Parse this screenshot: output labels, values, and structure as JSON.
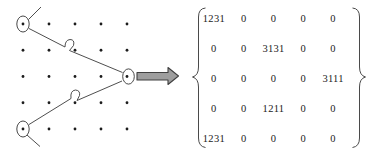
{
  "figure": {
    "grid": {
      "rows": 5,
      "cols": 5
    },
    "circled_nodes": [
      "row-1-col-1 (top-left)",
      "row-3-col-5 (middle-right)",
      "row-5-col-1 (bottom-left)"
    ],
    "paths": [
      "upper branch: top-left circled node down-right with hop to middle-right circled node",
      "lower branch: bottom-left circled node up-right with hop to middle-right circled node"
    ],
    "arrow": {
      "direction": "right",
      "fill": "#9e9e9e",
      "outline": "#404040"
    }
  },
  "matrix": {
    "left_delimiter": "{",
    "right_delimiter": "}",
    "rows": 5,
    "cols": 5,
    "values": [
      [
        "1231",
        "0",
        "0",
        "0",
        "0"
      ],
      [
        "0",
        "0",
        "3131",
        "0",
        "0"
      ],
      [
        "0",
        "0",
        "0",
        "0",
        "3111"
      ],
      [
        "0",
        "0",
        "1211",
        "0",
        "0"
      ],
      [
        "1231",
        "0",
        "0",
        "0",
        "0"
      ]
    ]
  },
  "colors": {
    "dot": "#1c1c1c",
    "line": "#3a3a3a",
    "brace": "#4a4a4a",
    "text": "#222222",
    "background": "#ffffff"
  }
}
